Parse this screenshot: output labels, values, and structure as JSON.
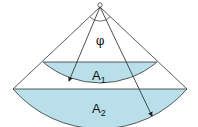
{
  "diagram": {
    "labels": {
      "angle": "φ",
      "area1": "A",
      "area1_sub": "1",
      "area2": "A",
      "area2_sub": "2"
    },
    "colors": {
      "fill": "#b8dfea",
      "stroke": "#333333"
    }
  }
}
